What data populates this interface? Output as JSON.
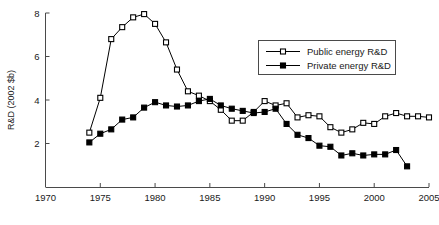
{
  "chart_data": {
    "type": "line",
    "title": "",
    "xlabel": "",
    "ylabel": "R&D (2002 $b)",
    "xlim": [
      1970,
      2005
    ],
    "ylim": [
      0,
      8
    ],
    "grid": false,
    "legend_position": "top-right",
    "x_ticks": [
      "1970",
      "1975",
      "1980",
      "1985",
      "1990",
      "1995",
      "2000",
      "2005"
    ],
    "x_tick_values": [
      1970,
      1975,
      1980,
      1985,
      1990,
      1995,
      2000,
      2005
    ],
    "y_ticks": [
      "2",
      "4",
      "6",
      "8"
    ],
    "y_tick_values": [
      2,
      4,
      6,
      8
    ],
    "series": [
      {
        "name": "Public energy R&D",
        "marker": "open-square",
        "x": [
          1974,
          1975,
          1976,
          1977,
          1978,
          1979,
          1980,
          1981,
          1982,
          1983,
          1984,
          1985,
          1986,
          1987,
          1988,
          1989,
          1990,
          1991,
          1992,
          1993,
          1994,
          1995,
          1996,
          1997,
          1998,
          1999,
          2000,
          2001,
          2002,
          2003,
          2004,
          2005
        ],
        "values": [
          2.5,
          4.1,
          6.8,
          7.35,
          7.8,
          7.95,
          7.5,
          6.65,
          5.4,
          4.4,
          4.2,
          3.95,
          3.55,
          3.05,
          3.05,
          3.45,
          3.95,
          3.75,
          3.85,
          3.2,
          3.3,
          3.25,
          2.75,
          2.5,
          2.65,
          2.95,
          2.9,
          3.25,
          3.4,
          3.25,
          3.25,
          3.2
        ]
      },
      {
        "name": "Private energy R&D",
        "marker": "filled-square",
        "x": [
          1974,
          1975,
          1976,
          1977,
          1978,
          1979,
          1980,
          1981,
          1982,
          1983,
          1984,
          1985,
          1986,
          1987,
          1988,
          1989,
          1990,
          1991,
          1992,
          1993,
          1994,
          1995,
          1996,
          1997,
          1998,
          1999,
          2000,
          2001,
          2002,
          2003
        ],
        "values": [
          2.05,
          2.45,
          2.65,
          3.1,
          3.2,
          3.65,
          3.9,
          3.75,
          3.7,
          3.75,
          3.95,
          4.05,
          3.75,
          3.6,
          3.5,
          3.4,
          3.45,
          3.6,
          2.9,
          2.4,
          2.25,
          1.9,
          1.85,
          1.45,
          1.55,
          1.45,
          1.5,
          1.5,
          1.7,
          0.95
        ]
      }
    ]
  },
  "legend": {
    "entries": [
      {
        "label": "Public energy R&D"
      },
      {
        "label": "Private energy R&D"
      }
    ]
  },
  "axes": {
    "y_title": "R&D (2002 $b)"
  }
}
